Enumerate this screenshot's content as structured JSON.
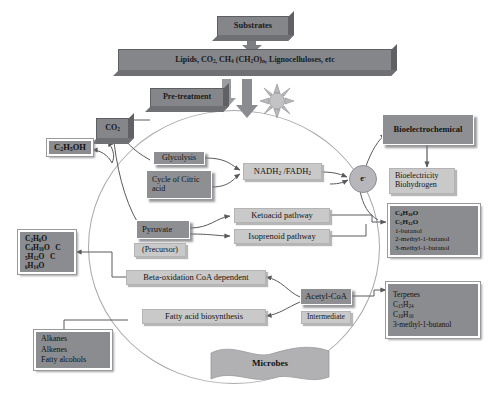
{
  "figure": {
    "colors": {
      "dark_block": "#84868a",
      "medium_box": "#8d8f93",
      "light_box": "#c9c9c9",
      "circle_outline": "#a9a9ad",
      "arrow": "#5a5a5e",
      "text": "#111111"
    }
  },
  "top": {
    "substrates_label": "Substrates",
    "substrate_list": "Lipids, CO2, CH4 (CH2O)n, Lignocelluloses, etc",
    "pretreatment_label": "Pre-treatment",
    "sun_icon": "sun-burst-icon"
  },
  "left": {
    "co2_label": "CO2",
    "ethanol_label": "C2H5OH",
    "alcohols_box": [
      "C2H6O",
      "C4H10O     C",
      "5H12O   C",
      "6H14O"
    ],
    "alkanes_box": [
      "Alkanes",
      "Alkenes",
      "Fatty alcohols"
    ]
  },
  "center": {
    "glycolysis": "Glycolysis",
    "citric_acid_cycle": "Cycle of Citric acid",
    "nadh_fadh": "NADH2 /FADH2",
    "pyruvate": "Pyruvate",
    "precursor": "(Precursor)",
    "ketoacid_pathway": "Ketoacid pathway",
    "isoprenoid_pathway": "Isoprenoid pathway",
    "beta_oxidation": "Beta-oxidation CoA dependent",
    "fatty_acid_biosynthesis": "Fatty acid biosynthesis",
    "acetyl_coa": "Acetyl-CoA",
    "intermediate": "Intermediate",
    "microbes": "Microbes",
    "electron_label": "e-"
  },
  "right": {
    "bioelectrochemical": "Bioelectrochemical",
    "bioelectricity_biohydrogen": [
      "Bioelectricity",
      "Biohydrogen"
    ],
    "butanol_box": [
      "C4H10O",
      "C5H12O",
      "1-butanol",
      "2-methyl-1-butanol",
      "3-methyl-1-butanol"
    ],
    "terpenes_box": [
      "Terpenes",
      "C15H24",
      "C10H16",
      "3-methyl-1-butanol"
    ]
  }
}
